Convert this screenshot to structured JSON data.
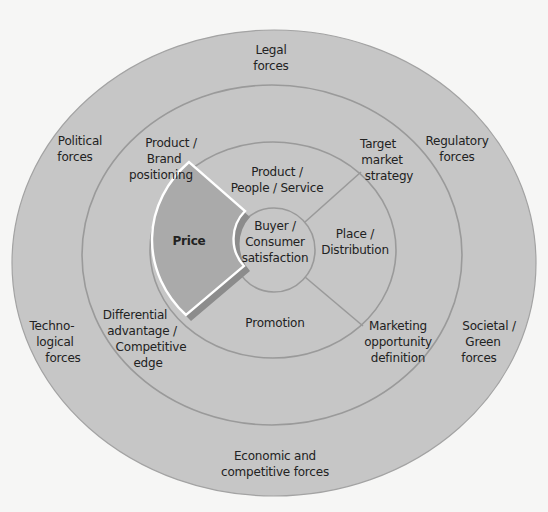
{
  "colors": {
    "background": "#f6f6f5",
    "ring_fill": "#c6c6c6",
    "ring_stroke": "#9a9a9a",
    "price_fill": "#a9a9a9",
    "price_shadow": "#8a8a8a",
    "price_border": "#ffffff",
    "text": "#222222"
  },
  "rings": {
    "outer": {
      "label": "Environmental forces",
      "cx": 274,
      "cy": 263,
      "rx": 262,
      "ry": 233
    },
    "middle": {
      "label": "Marketing strategy",
      "cx": 272,
      "cy": 255,
      "rx": 190,
      "ry": 170
    },
    "inner": {
      "label": "Marketing mix",
      "cx": 273,
      "cy": 250,
      "rx": 123,
      "ry": 108
    },
    "core": {
      "label": "Buyer / Consumer satisfaction",
      "cx": 274,
      "cy": 250,
      "rx": 41,
      "ry": 42
    }
  },
  "outer_labels": {
    "legal": [
      "Legal",
      "forces"
    ],
    "political": [
      "Political",
      "forces"
    ],
    "regulatory": [
      "Regulatory",
      "forces"
    ],
    "technological": [
      "Techno-",
      "logical",
      "forces"
    ],
    "societal": [
      "Societal /",
      "Green",
      "forces"
    ],
    "economic": [
      "Economic and",
      "competitive forces"
    ]
  },
  "middle_labels": {
    "product_brand": [
      "Product /",
      "Brand",
      "positioning"
    ],
    "target_market": [
      "Target",
      "market",
      "strategy"
    ],
    "differential": [
      "Differential",
      "advantage /",
      "Competitive",
      "edge"
    ],
    "marketing_opportunity": [
      "Marketing",
      "opportunity",
      "definition"
    ]
  },
  "mix_labels": {
    "product": [
      "Product /",
      "People / Service"
    ],
    "price": [
      "Price"
    ],
    "place": [
      "Place /",
      "Distribution"
    ],
    "promotion": [
      "Promotion"
    ]
  },
  "core_label": [
    "Buyer /",
    "Consumer",
    "satisfaction"
  ],
  "highlighted_segment": "Price"
}
